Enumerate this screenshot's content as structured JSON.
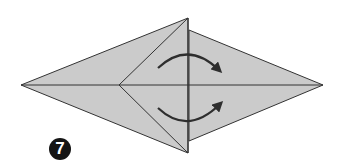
{
  "diagram": {
    "type": "origami-fold-step",
    "step_number": "7",
    "colors": {
      "paper_fill": "#cbcbcb",
      "line": "#333333",
      "arrow": "#2e2e2e",
      "badge_bg": "#151515",
      "badge_text": "#ffffff",
      "background": "#ffffff"
    },
    "shape": {
      "left_point": [
        21,
        85
      ],
      "right_point": [
        323,
        85
      ],
      "top_apex": [
        188,
        18
      ],
      "bottom_apex": [
        188,
        153
      ],
      "inner_vertex": [
        119,
        85
      ],
      "right_flap_top": [
        189,
        30
      ],
      "right_flap_bottom": [
        189,
        141
      ]
    },
    "arrows": [
      {
        "name": "top-rotate-arrow",
        "direction": "clockwise",
        "from": [
          158,
          68
        ],
        "to": [
          220,
          72
        ]
      },
      {
        "name": "bottom-rotate-arrow",
        "direction": "counter-clockwise",
        "from": [
          158,
          108
        ],
        "to": [
          221,
          102
        ]
      }
    ]
  }
}
